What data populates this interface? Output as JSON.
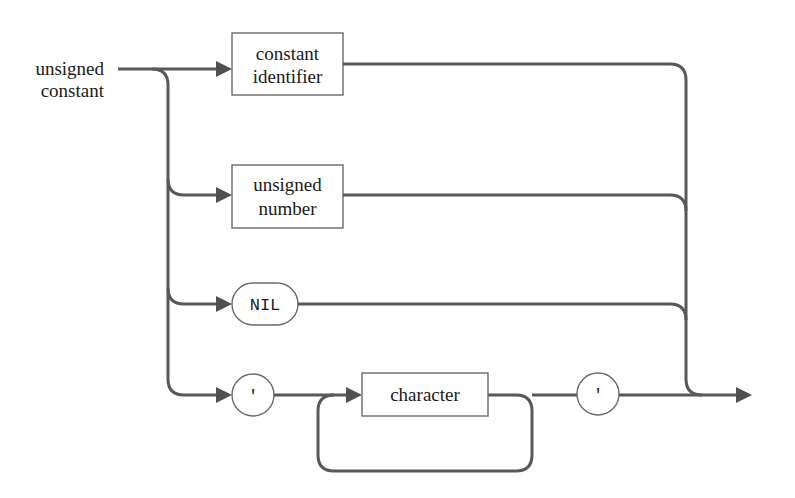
{
  "diagram": {
    "type": "syntax-diagram",
    "title_line1": "unsigned",
    "title_line2": "constant",
    "nodes": [
      {
        "kind": "nonterminal",
        "line1": "constant",
        "line2": "identifier"
      },
      {
        "kind": "nonterminal",
        "line1": "unsigned",
        "line2": "number"
      },
      {
        "kind": "terminal",
        "label": "NIL"
      },
      {
        "kind": "terminal",
        "label": "'"
      },
      {
        "kind": "nonterminal",
        "label": "character"
      },
      {
        "kind": "terminal",
        "label": "'"
      }
    ],
    "colors": {
      "line": "#585858",
      "box_border": "#6a6a6a",
      "text": "#1a1a1a",
      "background": "#ffffff"
    }
  }
}
